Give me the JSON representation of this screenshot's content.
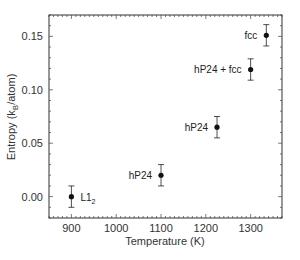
{
  "chart_data": {
    "type": "scatter",
    "title": "",
    "xlabel": "Temperature (K)",
    "ylabel": "Entropy (k_B/atom)",
    "ylabel_parts": {
      "pre": "Entropy (k",
      "sub": "B",
      "post": "/atom)"
    },
    "xlim": [
      850,
      1370
    ],
    "ylim": [
      -0.02,
      0.17
    ],
    "xticks": [
      900,
      1000,
      1100,
      1200,
      1300
    ],
    "xtick_labels": [
      "900",
      "1000",
      "1100",
      "1200",
      "1300"
    ],
    "yticks": [
      0.0,
      0.05,
      0.1,
      0.15
    ],
    "ytick_labels": [
      "0.00",
      "0.05",
      "0.10",
      "0.15"
    ],
    "grid": false,
    "legend": null,
    "series": [
      {
        "name": "Entropy",
        "points": [
          {
            "x": 900,
            "y": 0.0,
            "err": 0.01,
            "label": "L1",
            "label_sub": "2"
          },
          {
            "x": 1100,
            "y": 0.02,
            "err": 0.01,
            "label": "hP24",
            "label_sub": ""
          },
          {
            "x": 1225,
            "y": 0.065,
            "err": 0.01,
            "label": "hP24",
            "label_sub": ""
          },
          {
            "x": 1300,
            "y": 0.119,
            "err": 0.01,
            "label": "hP24 + fcc",
            "label_sub": ""
          },
          {
            "x": 1335,
            "y": 0.151,
            "err": 0.01,
            "label": "fcc",
            "label_sub": ""
          }
        ]
      }
    ]
  }
}
